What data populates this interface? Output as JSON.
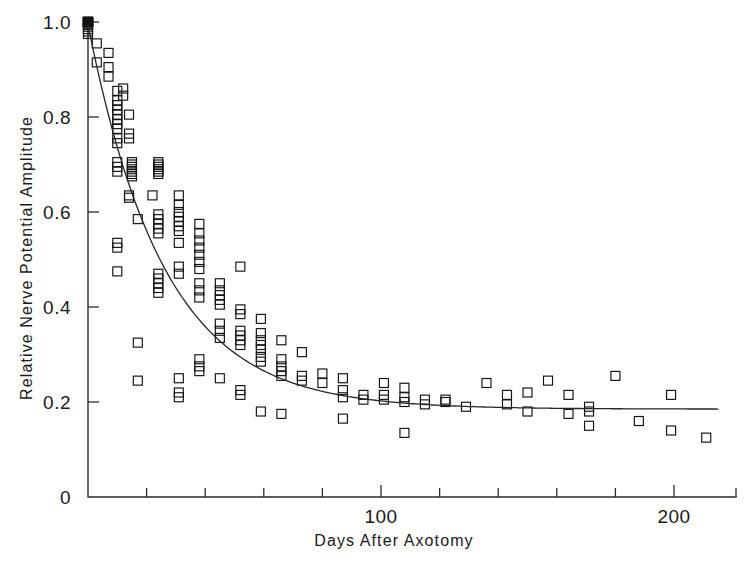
{
  "chart_data": {
    "type": "scatter",
    "title": "",
    "xlabel": "Days After Axotomy",
    "ylabel": "Relative Nerve Potential Amplitude",
    "xlim": [
      0,
      215
    ],
    "ylim": [
      0,
      1.04
    ],
    "grid": false,
    "legend": null,
    "x_ticks_major": [
      100,
      200
    ],
    "x_tick_labels": [
      "100",
      "200"
    ],
    "x_ticks_minor": [
      20,
      40,
      60,
      80,
      120,
      140,
      160,
      180
    ],
    "y_ticks": [
      0,
      0.2,
      0.4,
      0.6,
      0.8,
      1.0
    ],
    "y_tick_labels": [
      "0",
      "0.2",
      "0.4",
      "0.6",
      "0.8",
      "1.0"
    ],
    "marker_style": "open-square",
    "series": [
      {
        "name": "Relative nerve potential amplitude",
        "points": [
          [
            0,
            1.0
          ],
          [
            0,
            1.0
          ],
          [
            0,
            1.0
          ],
          [
            0,
            1.0
          ],
          [
            0,
            1.0
          ],
          [
            0,
            1.0
          ],
          [
            0,
            1.0
          ],
          [
            0,
            1.0
          ],
          [
            0,
            1.0
          ],
          [
            0,
            1.0
          ],
          [
            0,
            1.0
          ],
          [
            0,
            1.0
          ],
          [
            0,
            0.995
          ],
          [
            0,
            0.99
          ],
          [
            0,
            0.985
          ],
          [
            0,
            0.98
          ],
          [
            0,
            0.975
          ],
          [
            3,
            0.955
          ],
          [
            3,
            0.915
          ],
          [
            7,
            0.935
          ],
          [
            7,
            0.905
          ],
          [
            7,
            0.885
          ],
          [
            10,
            0.855
          ],
          [
            10,
            0.835
          ],
          [
            10,
            0.825
          ],
          [
            10,
            0.815
          ],
          [
            10,
            0.805
          ],
          [
            10,
            0.795
          ],
          [
            10,
            0.785
          ],
          [
            10,
            0.775
          ],
          [
            12,
            0.86
          ],
          [
            12,
            0.845
          ],
          [
            14,
            0.805
          ],
          [
            10,
            0.755
          ],
          [
            10,
            0.745
          ],
          [
            14,
            0.765
          ],
          [
            14,
            0.755
          ],
          [
            10,
            0.705
          ],
          [
            10,
            0.695
          ],
          [
            10,
            0.685
          ],
          [
            15,
            0.705
          ],
          [
            15,
            0.7
          ],
          [
            15,
            0.695
          ],
          [
            15,
            0.69
          ],
          [
            15,
            0.685
          ],
          [
            15,
            0.68
          ],
          [
            15,
            0.675
          ],
          [
            14,
            0.635
          ],
          [
            24,
            0.705
          ],
          [
            24,
            0.7
          ],
          [
            24,
            0.695
          ],
          [
            24,
            0.69
          ],
          [
            24,
            0.685
          ],
          [
            24,
            0.68
          ],
          [
            10,
            0.535
          ],
          [
            10,
            0.525
          ],
          [
            10,
            0.475
          ],
          [
            14,
            0.63
          ],
          [
            22,
            0.635
          ],
          [
            31,
            0.635
          ],
          [
            31,
            0.615
          ],
          [
            31,
            0.6
          ],
          [
            31,
            0.59
          ],
          [
            31,
            0.58
          ],
          [
            31,
            0.57
          ],
          [
            31,
            0.56
          ],
          [
            24,
            0.595
          ],
          [
            24,
            0.585
          ],
          [
            24,
            0.575
          ],
          [
            24,
            0.565
          ],
          [
            24,
            0.555
          ],
          [
            17,
            0.585
          ],
          [
            31,
            0.535
          ],
          [
            24,
            0.47
          ],
          [
            24,
            0.46
          ],
          [
            24,
            0.45
          ],
          [
            24,
            0.44
          ],
          [
            24,
            0.43
          ],
          [
            31,
            0.485
          ],
          [
            31,
            0.47
          ],
          [
            38,
            0.575
          ],
          [
            38,
            0.555
          ],
          [
            38,
            0.54
          ],
          [
            38,
            0.525
          ],
          [
            38,
            0.51
          ],
          [
            38,
            0.495
          ],
          [
            38,
            0.48
          ],
          [
            38,
            0.45
          ],
          [
            38,
            0.435
          ],
          [
            38,
            0.42
          ],
          [
            45,
            0.45
          ],
          [
            45,
            0.435
          ],
          [
            45,
            0.425
          ],
          [
            45,
            0.415
          ],
          [
            45,
            0.405
          ],
          [
            45,
            0.365
          ],
          [
            45,
            0.35
          ],
          [
            45,
            0.335
          ],
          [
            52,
            0.485
          ],
          [
            52,
            0.395
          ],
          [
            52,
            0.385
          ],
          [
            52,
            0.35
          ],
          [
            52,
            0.34
          ],
          [
            52,
            0.33
          ],
          [
            52,
            0.32
          ],
          [
            59,
            0.375
          ],
          [
            59,
            0.345
          ],
          [
            59,
            0.33
          ],
          [
            59,
            0.32
          ],
          [
            59,
            0.31
          ],
          [
            59,
            0.295
          ],
          [
            59,
            0.285
          ],
          [
            66,
            0.33
          ],
          [
            66,
            0.29
          ],
          [
            66,
            0.275
          ],
          [
            66,
            0.265
          ],
          [
            66,
            0.255
          ],
          [
            73,
            0.305
          ],
          [
            73,
            0.255
          ],
          [
            73,
            0.245
          ],
          [
            17,
            0.325
          ],
          [
            17,
            0.245
          ],
          [
            31,
            0.25
          ],
          [
            31,
            0.22
          ],
          [
            31,
            0.21
          ],
          [
            38,
            0.29
          ],
          [
            38,
            0.275
          ],
          [
            38,
            0.265
          ],
          [
            45,
            0.25
          ],
          [
            52,
            0.225
          ],
          [
            52,
            0.215
          ],
          [
            59,
            0.18
          ],
          [
            66,
            0.175
          ],
          [
            80,
            0.26
          ],
          [
            80,
            0.24
          ],
          [
            87,
            0.25
          ],
          [
            87,
            0.225
          ],
          [
            87,
            0.21
          ],
          [
            87,
            0.165
          ],
          [
            94,
            0.215
          ],
          [
            94,
            0.205
          ],
          [
            101,
            0.24
          ],
          [
            101,
            0.215
          ],
          [
            101,
            0.205
          ],
          [
            108,
            0.23
          ],
          [
            108,
            0.21
          ],
          [
            108,
            0.2
          ],
          [
            108,
            0.135
          ],
          [
            115,
            0.205
          ],
          [
            115,
            0.195
          ],
          [
            122,
            0.205
          ],
          [
            122,
            0.2
          ],
          [
            129,
            0.19
          ],
          [
            136,
            0.24
          ],
          [
            143,
            0.215
          ],
          [
            143,
            0.195
          ],
          [
            150,
            0.22
          ],
          [
            150,
            0.18
          ],
          [
            157,
            0.245
          ],
          [
            164,
            0.215
          ],
          [
            164,
            0.175
          ],
          [
            171,
            0.19
          ],
          [
            171,
            0.18
          ],
          [
            171,
            0.15
          ],
          [
            180,
            0.255
          ],
          [
            188,
            0.16
          ],
          [
            199,
            0.215
          ],
          [
            199,
            0.14
          ],
          [
            211,
            0.125
          ]
        ]
      }
    ],
    "fit_curve": {
      "name": "exponential decay fit",
      "description": "Single exponential decay to a plateau fitted through the scatter",
      "model": "y = a * exp(-t / tau) + c",
      "a": 0.81,
      "tau": 26.0,
      "c": 0.185,
      "t_start": 0,
      "t_end": 215
    }
  },
  "axes": {
    "x_axis_name": "days-after-axotomy-axis",
    "y_axis_name": "relative-amplitude-axis"
  }
}
